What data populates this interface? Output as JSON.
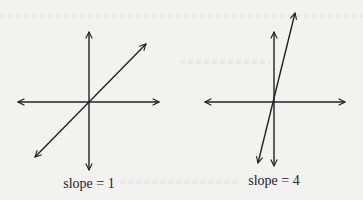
{
  "figure": {
    "panels": [
      {
        "id": "left",
        "caption": "slope = 1",
        "slope": 1,
        "origin": [
          89,
          102
        ],
        "h_axis": {
          "x1": 18,
          "x2": 159,
          "y": 102
        },
        "v_axis": {
          "x": 89,
          "y1": 32,
          "y2": 170
        },
        "line": {
          "x1": 35,
          "y1": 157,
          "x2": 146,
          "y2": 44
        }
      },
      {
        "id": "right",
        "caption": "slope = 4",
        "slope": 4,
        "origin": [
          274,
          102
        ],
        "h_axis": {
          "x1": 205,
          "x2": 345,
          "y": 102
        },
        "v_axis": {
          "x": 274,
          "y1": 32,
          "y2": 166
        },
        "line": {
          "x1": 258,
          "y1": 163,
          "x2": 295,
          "y2": 13
        }
      }
    ],
    "colors": {
      "background": "#f2f2f1",
      "stroke": "#222222"
    }
  }
}
